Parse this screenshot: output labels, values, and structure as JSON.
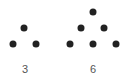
{
  "diagram": {
    "type": "triangular-numbers",
    "dot_color": "#222222",
    "label_color": "#555555",
    "groups": [
      {
        "label": "3",
        "label_pos": [
          25,
          69
        ],
        "dots": [
          [
            24,
            28
          ],
          [
            13,
            44
          ],
          [
            36,
            44
          ]
        ]
      },
      {
        "label": "6",
        "label_pos": [
          93,
          69
        ],
        "dots": [
          [
            93,
            12
          ],
          [
            81,
            28
          ],
          [
            104,
            28
          ],
          [
            70,
            44
          ],
          [
            93,
            44
          ],
          [
            116,
            44
          ]
        ]
      }
    ]
  }
}
